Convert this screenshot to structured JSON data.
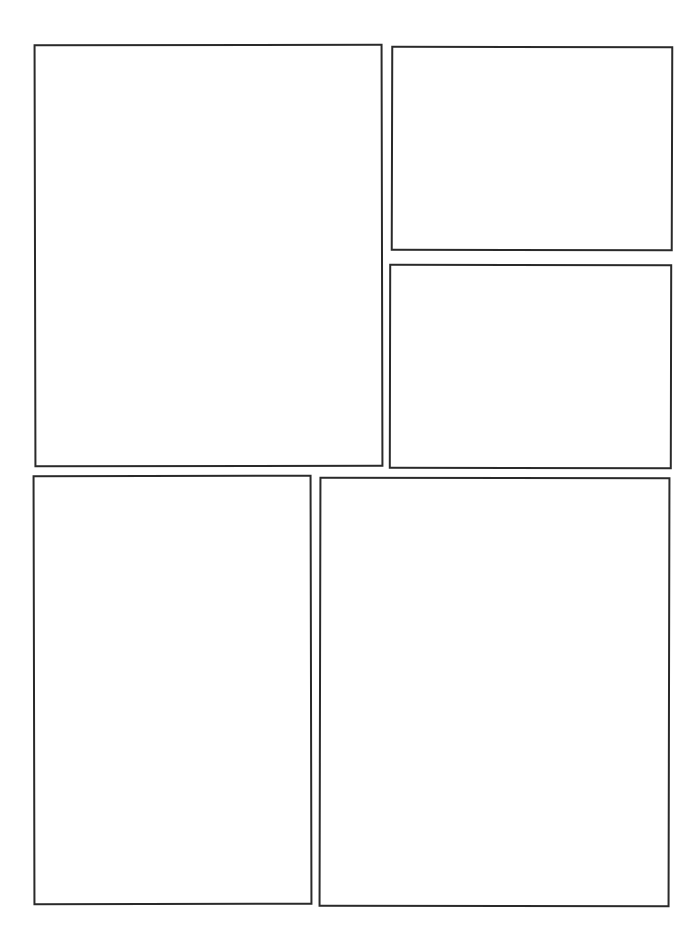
{
  "page": {
    "type": "blank comic page layout",
    "background": "#ffffff",
    "border_color": "#2a2a2a",
    "panels": [
      {
        "id": "panel-1",
        "position": "top-left",
        "content": ""
      },
      {
        "id": "panel-2",
        "position": "top-right-upper",
        "content": ""
      },
      {
        "id": "panel-3",
        "position": "top-right-lower",
        "content": ""
      },
      {
        "id": "panel-4",
        "position": "bottom-left",
        "content": ""
      },
      {
        "id": "panel-5",
        "position": "bottom-right",
        "content": ""
      }
    ]
  }
}
